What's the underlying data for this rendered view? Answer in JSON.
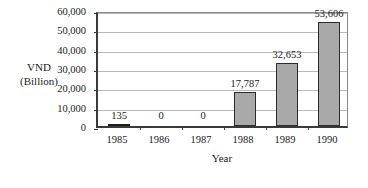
{
  "chart_data": {
    "type": "bar",
    "title": "",
    "subtitle": "",
    "xlabel": "Year",
    "ylabel": "VND\n(Billion)",
    "ylabel_lines": [
      "VND",
      "(Billion)"
    ],
    "categories": [
      "1985",
      "1986",
      "1987",
      "1988",
      "1989",
      "1990"
    ],
    "values": [
      135,
      0,
      0,
      17787,
      32653,
      53606
    ],
    "data_labels": [
      "135",
      "0",
      "0",
      "17,787",
      "32,653",
      "53,606"
    ],
    "ylim": [
      0,
      60000
    ],
    "ytick_values": [
      0,
      10000,
      20000,
      30000,
      40000,
      50000,
      60000
    ],
    "ytick_labels": [
      "0",
      "10,000",
      "20,000",
      "30,000",
      "40,000",
      "50,000",
      "60,000"
    ],
    "grid": "horizontal",
    "legend": "none",
    "series": [
      {
        "name": "VND (Billion)",
        "values": [
          135,
          0,
          0,
          17787,
          32653,
          53606
        ]
      }
    ],
    "colors": {
      "bar_fill": "#a9a9a9",
      "bar_border": "#2b2b2b",
      "gridline": "#b9b9b9",
      "axis": "#3a3a3a",
      "text": "#1a1a1a",
      "background": "#ffffff"
    }
  }
}
